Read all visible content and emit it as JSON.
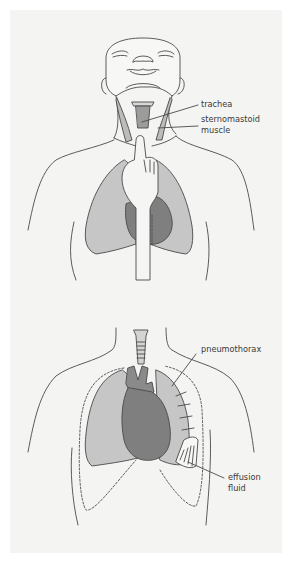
{
  "figure": {
    "colors": {
      "background": "#ffffff",
      "panel": "#f4f4f3",
      "outline": "#4a4a4a",
      "lung_light": "#c6c6c6",
      "heart_dark": "#7f7f7f",
      "muscle": "#b9b9b9"
    },
    "top_panel": {
      "description": "Patient head tilted back; examiner finger palpating trachea at suprasternal notch",
      "labels": [
        {
          "id": "trachea",
          "text": "trachea"
        },
        {
          "id": "sternomastoid-line1",
          "text": "sternomastoid"
        },
        {
          "id": "sternomastoid-line2",
          "text": "muscle"
        }
      ]
    },
    "bottom_panel": {
      "description": "Chest with trachea, heart and lungs showing pneumothorax and pleural effusion",
      "labels": [
        {
          "id": "pneumothorax",
          "text": "pneumothorax"
        },
        {
          "id": "effusion-line1",
          "text": "effusion"
        },
        {
          "id": "effusion-line2",
          "text": "fluid"
        }
      ]
    }
  }
}
